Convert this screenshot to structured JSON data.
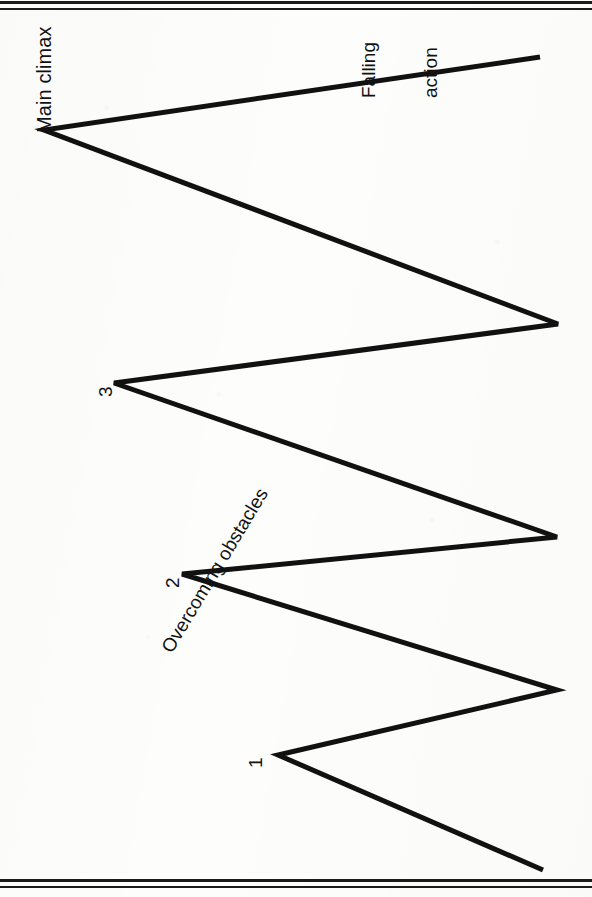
{
  "page": {
    "orientation": "rotated-90-clockwise",
    "background_color": "#fdfdfc",
    "ink_color": "#111111",
    "rule_color": "#1b1b1b"
  },
  "labels": {
    "main_climax": "Main climax",
    "falling_action_line1": "Falling",
    "falling_action_line2": "action",
    "overcoming_obstacles": "Overcoming obstacles",
    "peak_1": "1",
    "peak_2": "2",
    "peak_3": "3"
  },
  "chart_data": {
    "type": "line",
    "title": "",
    "subtitle": "",
    "xlabel": "",
    "ylabel": "",
    "grid": false,
    "legend": "none",
    "orientation": "rotated-90-clockwise",
    "line_color": "#111111",
    "line_width": 5,
    "xlim": [
      0,
      592
    ],
    "ylim": [
      0,
      897
    ],
    "annotations": [
      {
        "text": "Main climax",
        "x": 34,
        "y": 133,
        "rotation": -90
      },
      {
        "text": "Falling action",
        "x": 318,
        "y": 98,
        "rotation": -90
      },
      {
        "text": "Overcoming obstacles",
        "x": 158,
        "y": 646,
        "rotation": -59
      },
      {
        "text": "1",
        "x": 245,
        "y": 768,
        "rotation": -90
      },
      {
        "text": "2",
        "x": 162,
        "y": 588,
        "rotation": -90
      },
      {
        "text": "3",
        "x": 95,
        "y": 397,
        "rotation": -90
      }
    ],
    "points": [
      {
        "label": "start",
        "x": 543,
        "y": 870,
        "kind": "endpoint"
      },
      {
        "label": "1",
        "x": 278,
        "y": 755,
        "kind": "peak"
      },
      {
        "label": "valley-1",
        "x": 557,
        "y": 690,
        "kind": "valley"
      },
      {
        "label": "2",
        "x": 182,
        "y": 574,
        "kind": "peak"
      },
      {
        "label": "valley-2",
        "x": 557,
        "y": 537,
        "kind": "valley"
      },
      {
        "label": "3",
        "x": 114,
        "y": 383,
        "kind": "peak"
      },
      {
        "label": "valley-3",
        "x": 558,
        "y": 324,
        "kind": "valley"
      },
      {
        "label": "Main climax",
        "x": 44,
        "y": 130,
        "kind": "peak"
      },
      {
        "label": "end",
        "x": 540,
        "y": 57,
        "kind": "endpoint"
      }
    ],
    "polyline": "543,870 278,755 557,690 182,574 557,537 114,383 558,324 44,130 540,57"
  }
}
